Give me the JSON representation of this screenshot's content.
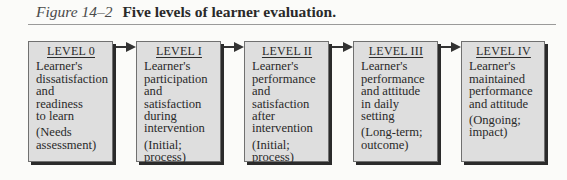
{
  "figure": {
    "label": "Figure 14–2",
    "caption": "Five levels of learner evaluation."
  },
  "levels": [
    {
      "title": "LEVEL 0",
      "lines": [
        "Learner's",
        "dissatisfaction",
        "and",
        "readiness",
        "to learn"
      ],
      "note_lines": [
        "(Needs",
        "assessment)"
      ]
    },
    {
      "title": "LEVEL I",
      "lines": [
        "Learner's",
        "participation",
        "and",
        "satisfaction",
        "during",
        "intervention"
      ],
      "note_lines": [
        "(Initial;",
        "process)"
      ]
    },
    {
      "title": "LEVEL II",
      "lines": [
        "Learner's",
        "performance",
        "and",
        "satisfaction",
        "after",
        "intervention"
      ],
      "note_lines": [
        "(Initial;",
        "process)"
      ]
    },
    {
      "title": "LEVEL III",
      "lines": [
        "Learner's",
        "performance",
        "and attitude",
        "in daily",
        "setting"
      ],
      "note_lines": [
        "(Long-term;",
        "outcome)"
      ]
    },
    {
      "title": "LEVEL IV",
      "lines": [
        "Learner's",
        "maintained",
        "performance",
        "and attitude"
      ],
      "note_lines": [
        "(Ongoing;",
        "impact)"
      ]
    }
  ],
  "colors": {
    "box_fill": "#dedede",
    "shadow": "#2b2b2b",
    "arrow": "#333333"
  }
}
